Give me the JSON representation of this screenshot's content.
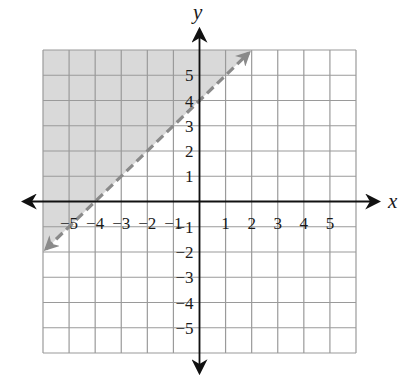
{
  "chart_data": {
    "type": "inequality-graph",
    "title": "",
    "xlabel": "x",
    "ylabel": "y",
    "xlim": [
      -6,
      6
    ],
    "ylim": [
      -6,
      6
    ],
    "grid": true,
    "x_ticks": [
      -5,
      -4,
      -3,
      -2,
      -1,
      1,
      2,
      3,
      4,
      5
    ],
    "y_ticks": [
      -5,
      -4,
      -3,
      -2,
      -1,
      1,
      2,
      3,
      4,
      5
    ],
    "x_tick_labels": [
      "−5",
      "−4",
      "−3",
      "−2",
      "−1",
      "1",
      "2",
      "3",
      "4",
      "5"
    ],
    "y_tick_labels": [
      "−5",
      "−4",
      "−3",
      "−2",
      "−1",
      "1",
      "2",
      "3",
      "4",
      "5"
    ],
    "boundary_line": {
      "equation": "y = x + 4",
      "slope": 1,
      "intercept": 4,
      "style": "dashed",
      "from": [
        -6,
        -2
      ],
      "to": [
        2,
        6
      ],
      "arrows": "both"
    },
    "shaded_region": "above line",
    "inequality": "y > x + 4",
    "colors": {
      "shade": "#d9d9d9",
      "grid": "#9a9a9a",
      "boundary": "#8a8a8a",
      "axes": "#111111"
    }
  }
}
